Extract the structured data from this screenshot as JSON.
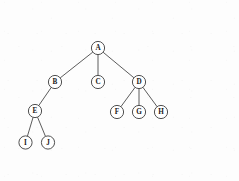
{
  "diagram": {
    "type": "tree",
    "background_color": "#fdfdfd",
    "node_fill_color": "#ffffff",
    "node_stroke_color": "#3c3c3c",
    "edge_color": "#4a4a4a",
    "label_color": "#1a1a1a",
    "node_radius": 6.6,
    "root": "A",
    "nodes": [
      {
        "id": "A",
        "label": "A",
        "x": 98,
        "y": 48,
        "level": 0
      },
      {
        "id": "B",
        "label": "B",
        "x": 55,
        "y": 82,
        "level": 1
      },
      {
        "id": "C",
        "label": "C",
        "x": 98,
        "y": 82,
        "level": 1
      },
      {
        "id": "D",
        "label": "D",
        "x": 139,
        "y": 82,
        "level": 1
      },
      {
        "id": "E",
        "label": "E",
        "x": 35,
        "y": 111,
        "level": 2
      },
      {
        "id": "F",
        "label": "F",
        "x": 117,
        "y": 112,
        "level": 2
      },
      {
        "id": "G",
        "label": "G",
        "x": 139,
        "y": 112,
        "level": 2
      },
      {
        "id": "H",
        "label": "H",
        "x": 161,
        "y": 112,
        "level": 2
      },
      {
        "id": "I",
        "label": "I",
        "x": 25.5,
        "y": 142.5,
        "level": 3
      },
      {
        "id": "J",
        "label": "J",
        "x": 48,
        "y": 142.5,
        "level": 3
      }
    ],
    "edges": [
      {
        "from": "A",
        "to": "B"
      },
      {
        "from": "A",
        "to": "C"
      },
      {
        "from": "A",
        "to": "D"
      },
      {
        "from": "B",
        "to": "E"
      },
      {
        "from": "D",
        "to": "F"
      },
      {
        "from": "D",
        "to": "G"
      },
      {
        "from": "D",
        "to": "H"
      },
      {
        "from": "E",
        "to": "I"
      },
      {
        "from": "E",
        "to": "J"
      }
    ]
  }
}
